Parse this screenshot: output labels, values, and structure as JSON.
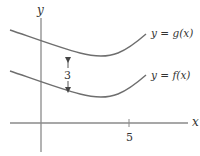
{
  "diagram": {
    "axes": {
      "x_label": "x",
      "y_label": "y",
      "x_tick_label": "5",
      "axis_color": "#8a8a8a"
    },
    "curves": [
      {
        "name": "g",
        "label": "y = g(x)",
        "color": "#6e6e6e"
      },
      {
        "name": "f",
        "label": "y = f(x)",
        "color": "#6e6e6e"
      }
    ],
    "vertical_shift": {
      "label": "3",
      "description": "g is f shifted up by 3"
    }
  }
}
